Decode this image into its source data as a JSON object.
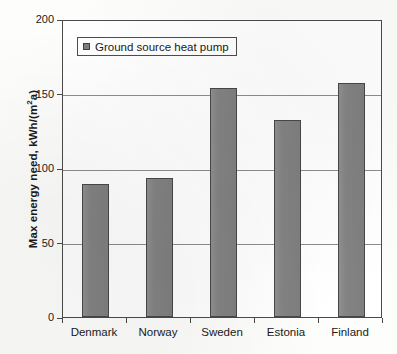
{
  "chart_data": {
    "type": "bar",
    "title": "",
    "xlabel": "",
    "ylabel": "Max energy need, kWh/(m²a)",
    "ylabel_main": "Max energy need, kWh/(m",
    "ylabel_sup": "2",
    "ylabel_tail": "a)",
    "categories": [
      "Denmark",
      "Norway",
      "Sweden",
      "Estonia",
      "Finland"
    ],
    "values": [
      89,
      93,
      154,
      132,
      157
    ],
    "series": [
      {
        "name": "Ground source heat pump",
        "values": [
          89,
          93,
          154,
          132,
          157
        ]
      }
    ],
    "ylim": [
      0,
      200
    ],
    "yticks": [
      0,
      50,
      100,
      150,
      200
    ],
    "ytick_labels": [
      "0",
      "50",
      "100",
      "150",
      "200"
    ],
    "grid": "horizontal",
    "legend_position": "top-left",
    "legend": [
      "Ground source heat pump"
    ],
    "bar_color": "#838383",
    "bar_border_color": "#474747",
    "gridline_color": "#8d8d8d",
    "axis_color": "#4a4a4a",
    "plot_background": "#ffffff"
  }
}
